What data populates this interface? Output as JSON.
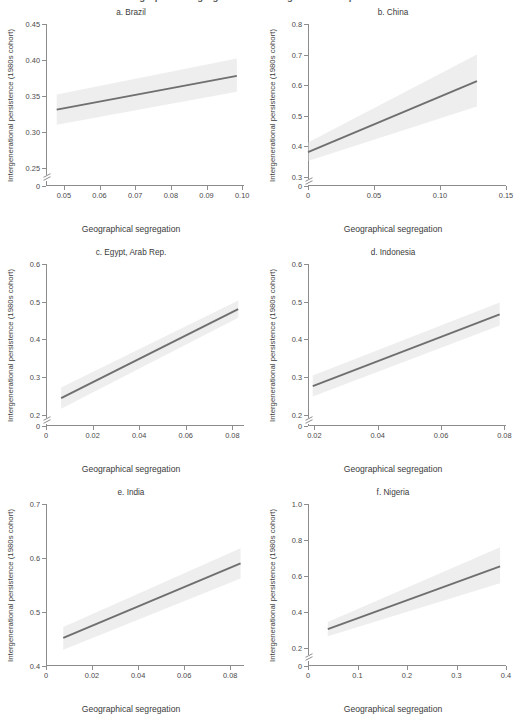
{
  "figure": {
    "supertitle": "Geographical segregation and intergenerational persistence",
    "x_axis_label": "Geographical segregation",
    "y_axis_label": "Intergenerational persistence (1980s cohort)",
    "line_color": "#6f6f6f",
    "band_color": "#d9d9d9",
    "axis_color": "#8d8d8d"
  },
  "chart_data": [
    {
      "type": "line",
      "panel_id": "a",
      "title": "a. Brazil",
      "xlabel": "Geographical segregation",
      "ylabel": "Intergenerational persistence (1980s cohort)",
      "xlim": [
        0.045,
        0.1005
      ],
      "ylim": [
        0.225,
        0.45
      ],
      "y_axis_break": true,
      "y_zero_label": "0",
      "xticks": [
        0.05,
        0.06,
        0.07,
        0.08,
        0.09,
        0.1
      ],
      "xticklabels": [
        "0.05",
        "0.06",
        "0.07",
        "0.08",
        "0.09",
        "0.10"
      ],
      "yticks": [
        0.25,
        0.3,
        0.35,
        0.4,
        0.45
      ],
      "yticklabels": [
        "0.25",
        "0.30",
        "0.35",
        "0.40",
        "0.45"
      ],
      "grid": false,
      "legend": "none",
      "series": [
        {
          "name": "fitted regression line",
          "x": [
            0.048,
            0.0985
          ],
          "y": [
            0.331,
            0.378
          ]
        }
      ],
      "confidence_band": {
        "x": [
          0.048,
          0.0985
        ],
        "upper": [
          0.352,
          0.402
        ],
        "lower": [
          0.31,
          0.356
        ]
      }
    },
    {
      "type": "line",
      "panel_id": "b",
      "title": "b. China",
      "xlabel": "Geographical segregation",
      "ylabel": "Intergenerational persistence (1980s cohort)",
      "xlim": [
        0.0,
        0.15
      ],
      "ylim": [
        0.27,
        0.8
      ],
      "y_axis_break": true,
      "y_zero_label": "0",
      "xticks": [
        0.0,
        0.05,
        0.1,
        0.15
      ],
      "xticklabels": [
        "0",
        "0.05",
        "0.10",
        "0.15"
      ],
      "yticks": [
        0.3,
        0.4,
        0.5,
        0.6,
        0.7,
        0.8
      ],
      "yticklabels": [
        "0.3",
        "0.4",
        "0.5",
        "0.6",
        "0.7",
        "0.8"
      ],
      "grid": false,
      "legend": "none",
      "series": [
        {
          "name": "fitted regression line",
          "x": [
            0.0,
            0.128
          ],
          "y": [
            0.381,
            0.613
          ]
        }
      ],
      "confidence_band": {
        "x": [
          0.0,
          0.128
        ],
        "upper": [
          0.412,
          0.7
        ],
        "lower": [
          0.352,
          0.53
        ]
      }
    },
    {
      "type": "line",
      "panel_id": "c",
      "title": "c. Egypt, Arab Rep.",
      "xlabel": "Geographical segregation",
      "ylabel": "Intergenerational persistence (1980s cohort)",
      "xlim": [
        0.0,
        0.085
      ],
      "ylim": [
        0.17,
        0.6
      ],
      "y_axis_break": true,
      "y_zero_label": "0",
      "xticks": [
        0.0,
        0.02,
        0.04,
        0.06,
        0.08
      ],
      "xticklabels": [
        "0",
        "0.02",
        "0.04",
        "0.06",
        "0.08"
      ],
      "yticks": [
        0.2,
        0.3,
        0.4,
        0.5,
        0.6
      ],
      "yticklabels": [
        "0.2",
        "0.3",
        "0.4",
        "0.5",
        "0.6"
      ],
      "grid": false,
      "legend": "none",
      "series": [
        {
          "name": "fitted regression line",
          "x": [
            0.0065,
            0.0825
          ],
          "y": [
            0.244,
            0.48
          ]
        }
      ],
      "confidence_band": {
        "x": [
          0.0065,
          0.0825
        ],
        "upper": [
          0.272,
          0.503
        ],
        "lower": [
          0.216,
          0.457
        ]
      }
    },
    {
      "type": "line",
      "panel_id": "d",
      "title": "d. Indonesia",
      "xlabel": "Geographical segregation",
      "ylabel": "Intergenerational persistence (1980s cohort)",
      "xlim": [
        0.018,
        0.0805
      ],
      "ylim": [
        0.17,
        0.6
      ],
      "y_axis_break": true,
      "y_zero_label": "0",
      "xticks": [
        0.02,
        0.04,
        0.06,
        0.08
      ],
      "xticklabels": [
        "0.02",
        "0.04",
        "0.06",
        "0.08"
      ],
      "yticks": [
        0.2,
        0.3,
        0.4,
        0.5,
        0.6
      ],
      "yticklabels": [
        "0.2",
        "0.3",
        "0.4",
        "0.5",
        "0.6"
      ],
      "grid": false,
      "legend": "none",
      "series": [
        {
          "name": "fitted regression line",
          "x": [
            0.0195,
            0.0785
          ],
          "y": [
            0.276,
            0.466
          ]
        }
      ],
      "confidence_band": {
        "x": [
          0.0195,
          0.0785
        ],
        "upper": [
          0.304,
          0.498
        ],
        "lower": [
          0.248,
          0.437
        ]
      }
    },
    {
      "type": "line",
      "panel_id": "e",
      "title": "e. India",
      "xlabel": "Geographical segregation",
      "ylabel": "Intergenerational persistence (1980s cohort)",
      "xlim": [
        0.0,
        0.086
      ],
      "ylim": [
        0.4,
        0.7
      ],
      "y_axis_break": false,
      "y_zero_label": null,
      "xticks": [
        0.0,
        0.02,
        0.04,
        0.06,
        0.08
      ],
      "xticklabels": [
        "0",
        "0.02",
        "0.04",
        "0.06",
        "0.08"
      ],
      "yticks": [
        0.4,
        0.5,
        0.6,
        0.7
      ],
      "yticklabels": [
        "0.4",
        "0.5",
        "0.6",
        "0.7"
      ],
      "grid": false,
      "legend": "none",
      "series": [
        {
          "name": "fitted regression line",
          "x": [
            0.0075,
            0.0845
          ],
          "y": [
            0.452,
            0.59
          ]
        }
      ],
      "confidence_band": {
        "x": [
          0.0075,
          0.0845
        ],
        "upper": [
          0.472,
          0.618
        ],
        "lower": [
          0.43,
          0.562
        ]
      }
    },
    {
      "type": "line",
      "panel_id": "f",
      "title": "f. Nigeria",
      "xlabel": "Geographical segregation",
      "ylabel": "Intergenerational persistence (1980s cohort)",
      "xlim": [
        0.0,
        0.4
      ],
      "ylim": [
        0.1,
        1.0
      ],
      "y_axis_break": true,
      "y_zero_label": "0",
      "xticks": [
        0.0,
        0.1,
        0.2,
        0.3,
        0.4
      ],
      "xticklabels": [
        "0",
        "0.1",
        "0.2",
        "0.3",
        "0.4"
      ],
      "yticks": [
        0.2,
        0.4,
        0.6,
        0.8,
        1.0
      ],
      "yticklabels": [
        "0.2",
        "0.4",
        "0.6",
        "0.8",
        "1.0"
      ],
      "grid": false,
      "legend": "none",
      "series": [
        {
          "name": "fitted regression line",
          "x": [
            0.04,
            0.388
          ],
          "y": [
            0.305,
            0.653
          ]
        }
      ],
      "confidence_band": {
        "x": [
          0.04,
          0.388
        ],
        "upper": [
          0.345,
          0.76
        ],
        "lower": [
          0.265,
          0.56
        ]
      }
    }
  ]
}
